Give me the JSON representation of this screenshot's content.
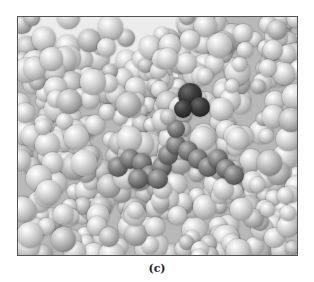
{
  "figure": {
    "caption": "(c)",
    "colors": {
      "protein_atoms": "#c8c8c8",
      "ligand_atoms": "#6a6a6a",
      "pocket_shadow": "#1e1e1e",
      "background": "#ececec",
      "frame_border": "#555555"
    }
  }
}
